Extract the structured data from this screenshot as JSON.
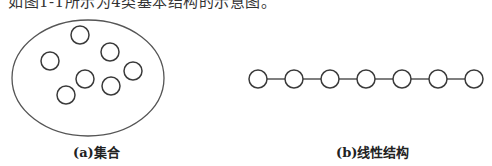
{
  "caption": {
    "text": "如图1-1所示为4类基本结构的示意图。"
  },
  "diagrams": [
    {
      "id": "set",
      "label": "(a)集合",
      "container": {
        "shape": "ellipse",
        "cx": 88,
        "cy": 78,
        "rx": 76,
        "ry": 58
      },
      "nodes": [
        {
          "cx": 80,
          "cy": 35,
          "r": 9
        },
        {
          "cx": 110,
          "cy": 52,
          "r": 9
        },
        {
          "cx": 50,
          "cy": 61,
          "r": 9
        },
        {
          "cx": 133,
          "cy": 71,
          "r": 9
        },
        {
          "cx": 85,
          "cy": 79,
          "r": 9
        },
        {
          "cx": 111,
          "cy": 86,
          "r": 9
        },
        {
          "cx": 66,
          "cy": 95,
          "r": 9
        }
      ]
    },
    {
      "id": "linear",
      "label": "(b)线性结构",
      "nodes": [
        {
          "cx": 258,
          "cy": 79,
          "r": 9
        },
        {
          "cx": 294,
          "cy": 79,
          "r": 9
        },
        {
          "cx": 330,
          "cy": 79,
          "r": 9
        },
        {
          "cx": 366,
          "cy": 79,
          "r": 9
        },
        {
          "cx": 402,
          "cy": 79,
          "r": 9
        },
        {
          "cx": 438,
          "cy": 79,
          "r": 9
        },
        {
          "cx": 474,
          "cy": 79,
          "r": 9
        }
      ]
    }
  ],
  "colors": {
    "stroke": "#3a3a3a",
    "edge": "#555555",
    "ellipse": "#555555",
    "background": "#ffffff"
  }
}
